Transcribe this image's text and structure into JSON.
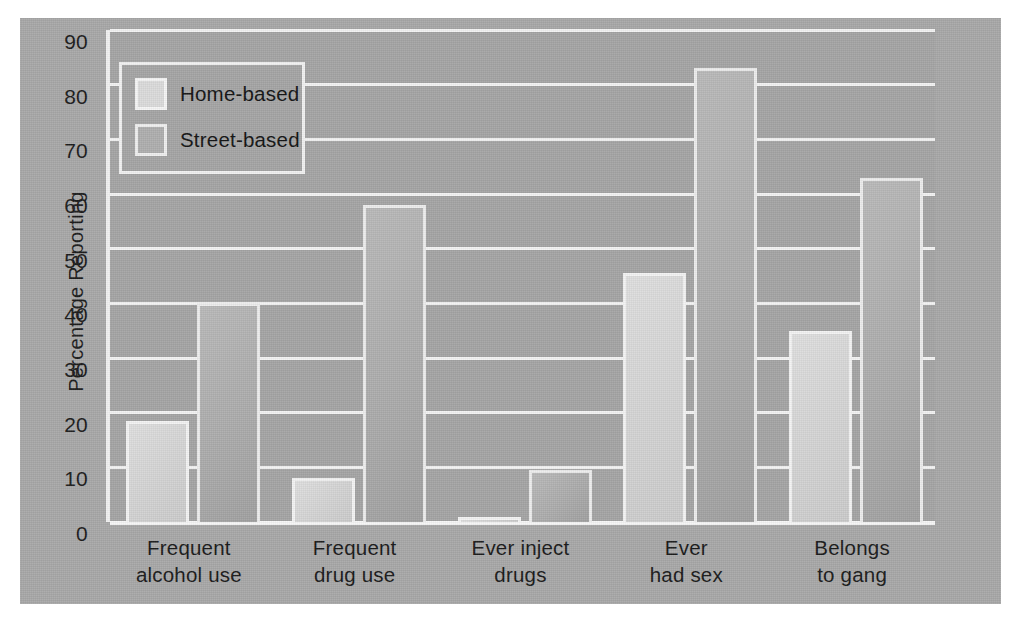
{
  "figure": {
    "background_color": "#a9a9a9",
    "plot_background_color": "#a6a6a6",
    "gridline_color": "#f4f4f4"
  },
  "legend": {
    "position": "top-left",
    "entries": [
      {
        "label": "Home-based",
        "swatch": "legend-swatch-home-based",
        "color": "#dcdcdc"
      },
      {
        "label": "Street-based",
        "swatch": "legend-swatch-street-based",
        "color": "#b0b0b0"
      }
    ]
  },
  "axes": {
    "ylabel": "Percentage Reporting",
    "yticks": [
      "90",
      "80",
      "70",
      "60",
      "50",
      "40",
      "30",
      "20",
      "10",
      "0"
    ],
    "ymin": 0,
    "ymax": 90,
    "ystep": 10
  },
  "categories_display": [
    {
      "line1": "Frequent",
      "line2": "alcohol use"
    },
    {
      "line1": "Frequent",
      "line2": "drug use"
    },
    {
      "line1": "Ever inject",
      "line2": "drugs"
    },
    {
      "line1": "Ever",
      "line2": "had sex"
    },
    {
      "line1": "Belongs",
      "line2": "to gang"
    }
  ],
  "chart_data": {
    "type": "bar",
    "title": "",
    "xlabel": "",
    "ylabel": "Percentage Reporting",
    "ylim": [
      0,
      90
    ],
    "ytick_step": 10,
    "grid": true,
    "legend_position": "upper left",
    "categories": [
      "Frequent alcohol use",
      "Frequent drug use",
      "Ever inject drugs",
      "Ever had sex",
      "Belongs to gang"
    ],
    "series": [
      {
        "name": "Home-based",
        "color": "#dcdcdc",
        "values": [
          18.5,
          8,
          1,
          45.5,
          35
        ]
      },
      {
        "name": "Street-based",
        "color": "#b0b0b0",
        "values": [
          40,
          58,
          9.5,
          83,
          63
        ]
      }
    ]
  }
}
